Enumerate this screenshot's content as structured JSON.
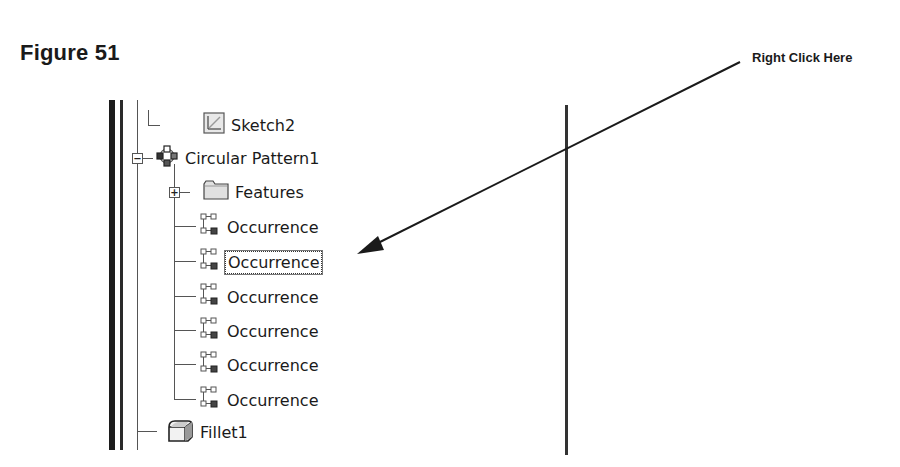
{
  "figure": {
    "title": "Figure 51"
  },
  "callout": {
    "text": "Right Click Here"
  },
  "tree": {
    "items": [
      {
        "label": "Sketch2",
        "icon": "sketch-icon"
      },
      {
        "label": "Circular Pattern1",
        "icon": "circular-pattern-icon",
        "expander": "−"
      },
      {
        "label": "Features",
        "icon": "folder-icon",
        "expander": "+"
      },
      {
        "label": "Occurrence",
        "icon": "occurrence-icon"
      },
      {
        "label": "Occurrence",
        "icon": "occurrence-icon",
        "selected": true
      },
      {
        "label": "Occurrence",
        "icon": "occurrence-icon"
      },
      {
        "label": "Occurrence",
        "icon": "occurrence-icon"
      },
      {
        "label": "Occurrence",
        "icon": "occurrence-icon"
      },
      {
        "label": "Occurrence",
        "icon": "occurrence-icon"
      },
      {
        "label": "Fillet1",
        "icon": "fillet-icon"
      }
    ]
  }
}
